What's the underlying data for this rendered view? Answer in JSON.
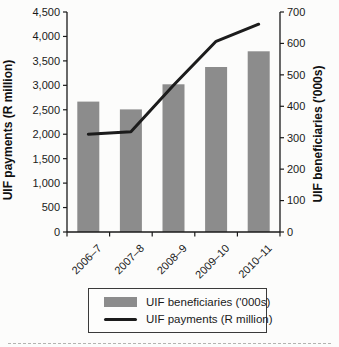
{
  "chart_data": {
    "type": "combo",
    "categories": [
      "2006–7",
      "2007–8",
      "2008–9",
      "2009–10",
      "2010–11"
    ],
    "series": [
      {
        "name": "UIF beneficiaries ('000s)",
        "type": "bar",
        "axis": "right",
        "values": [
          415,
          390,
          470,
          525,
          575
        ],
        "color": "#8c8c8c"
      },
      {
        "name": "UIF payments (R million)",
        "type": "line",
        "axis": "left",
        "values": [
          2000,
          2050,
          3000,
          3900,
          4250
        ],
        "color": "#1c1c1c"
      }
    ],
    "left_axis": {
      "label": "UIF payments (R million)",
      "min": 0,
      "max": 4500,
      "step": 500,
      "tick_labels": [
        "0",
        "500",
        "1,000",
        "1,500",
        "2,000",
        "2,500",
        "3,000",
        "3,500",
        "4,000",
        "4,500"
      ]
    },
    "right_axis": {
      "label": "UIF beneficiaries ('000s)",
      "min": 0,
      "max": 700,
      "step": 100,
      "tick_labels": [
        "0",
        "100",
        "200",
        "300",
        "400",
        "500",
        "600",
        "700"
      ]
    },
    "legend": {
      "position": "bottom",
      "entries": [
        "UIF beneficiaries ('000s)",
        "UIF payments (R million)"
      ]
    },
    "grid": false,
    "axis_color": "#1a1a1a"
  }
}
